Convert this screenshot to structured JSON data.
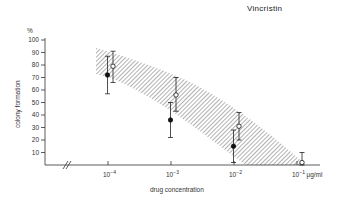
{
  "chart_data": {
    "type": "scatter",
    "title": "Vincristin",
    "xlabel": "drug concentration",
    "ylabel": "colony formation",
    "y_unit": "%",
    "x_unit": "µg/ml",
    "x_scale": "log",
    "categories": [
      "10^-4",
      "10^-3",
      "10^-2",
      "10^-1"
    ],
    "x_values": [
      0.0001,
      0.001,
      0.01,
      0.1
    ],
    "y_ticks": [
      10,
      20,
      30,
      40,
      50,
      60,
      70,
      80,
      90,
      100
    ],
    "ylim": [
      0,
      100
    ],
    "axis_break": "x-axis break (//) between origin and 10^-4",
    "grid": false,
    "legend": "none",
    "series": [
      {
        "name": "filled circles",
        "marker": "filled-circle",
        "points": [
          {
            "x": 0.0001,
            "y": 72,
            "err_low": 57,
            "err_high": 87
          },
          {
            "x": 0.001,
            "y": 36,
            "err_low": 22,
            "err_high": 50
          },
          {
            "x": 0.01,
            "y": 15,
            "err_low": 2,
            "err_high": 28
          }
        ]
      },
      {
        "name": "open circles",
        "marker": "open-circle",
        "points": [
          {
            "x": 0.0001,
            "y": 79,
            "err_low": 66,
            "err_high": 91
          },
          {
            "x": 0.001,
            "y": 56,
            "err_low": 43,
            "err_high": 70
          },
          {
            "x": 0.01,
            "y": 31,
            "err_low": 20,
            "err_high": 42
          },
          {
            "x": 0.1,
            "y": 2,
            "err_low": 0,
            "err_high": 10
          }
        ]
      }
    ],
    "shaded_band": {
      "description": "hatched confidence band",
      "upper": [
        {
          "x": 9e-05,
          "y": 93
        },
        {
          "x": 0.001,
          "y": 73
        },
        {
          "x": 0.01,
          "y": 43
        },
        {
          "x": 0.12,
          "y": 0
        }
      ],
      "lower": [
        {
          "x": 9e-05,
          "y": 55
        },
        {
          "x": 0.0002,
          "y": 50
        },
        {
          "x": 0.006,
          "y": 0
        }
      ]
    }
  },
  "labels": {
    "title": "Vincristin",
    "y_unit": "%",
    "y_axis": "colony formation",
    "x_axis": "drug concentration",
    "x_unit": "µg/ml",
    "y_ticks": [
      "100",
      "90",
      "80",
      "70",
      "60",
      "50",
      "40",
      "30",
      "20",
      "10"
    ],
    "x_ticks": [
      "10",
      "10",
      "10",
      "10"
    ],
    "x_exps": [
      "-4",
      "-3",
      "-2",
      "-1"
    ]
  }
}
